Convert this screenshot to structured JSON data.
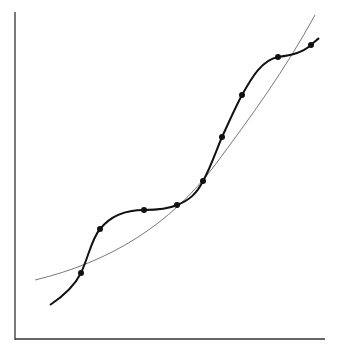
{
  "chart_data": {
    "type": "line",
    "title": "",
    "xlabel": "",
    "ylabel": "",
    "grid": false,
    "legend": null,
    "pixel_frame": {
      "x_axis_y": 339,
      "y_axis_x": 15,
      "x_axis_end": 325,
      "y_axis_top": 12
    },
    "series": [
      {
        "name": "data-points",
        "style": "markers",
        "points_px": [
          [
            81,
            273
          ],
          [
            100,
            229
          ],
          [
            144,
            210
          ],
          [
            177,
            205
          ],
          [
            203,
            181
          ],
          [
            222,
            137
          ],
          [
            242,
            95
          ],
          [
            278,
            57
          ],
          [
            311,
            45
          ]
        ]
      },
      {
        "name": "interpolating-curve",
        "style": "solid-thick",
        "path": "M50,305 C62,297 74,287 81,273 C88,258 92,238 100,229 C112,214 128,210 144,210 C158,210 168,209 177,205 C190,200 197,193 203,181 C211,167 216,151 222,137 C229,122 235,108 242,95 C252,77 262,60 278,57 C292,55 302,53 311,45 C314,42 317,40 319,38"
      },
      {
        "name": "fit-curve",
        "style": "solid-thin",
        "path": "M35,280 C110,262 170,225 215,165 C250,118 285,70 315,15"
      }
    ]
  }
}
